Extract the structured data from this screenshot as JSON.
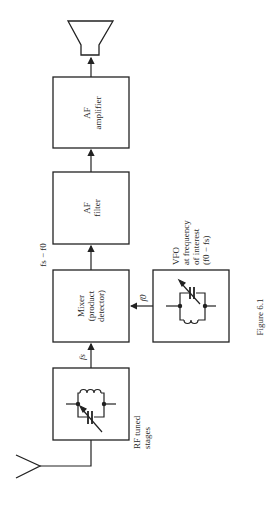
{
  "figure": {
    "caption": "Figure 6.1",
    "orientation": "rotated-90-ccw",
    "line_color": "#222222",
    "background": "#ffffff"
  },
  "blocks": {
    "af_amplifier": {
      "line1": "AF",
      "line2": "amplifier"
    },
    "af_filter": {
      "line1": "AF",
      "line2": "filter"
    },
    "mixer": {
      "line1": "Mixer",
      "line2": "(product",
      "line3": "detector)"
    },
    "vfo": {
      "line1": "VFO",
      "line2": "at frequency",
      "line3": "of interest",
      "line4": "(f0 − fs)"
    },
    "rf_stages": {
      "line1": "RF tuned",
      "line2": "stages"
    }
  },
  "signals": {
    "rf_to_mixer": "fs",
    "vfo_to_mixer": "f0",
    "mixer_to_filter": "fs − f0"
  },
  "icons": {
    "speaker": "speaker-icon",
    "antenna": "antenna-icon",
    "tuned_circuit": "lc-tank-icon"
  }
}
